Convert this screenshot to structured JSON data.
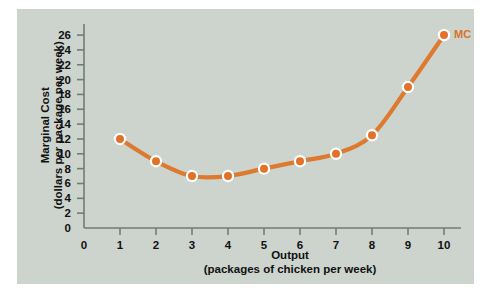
{
  "figure": {
    "panel_color": "#ccd4cd",
    "page_color": "#ffffff",
    "axis_color": "#6f7d76",
    "text_color": "#111111"
  },
  "chart_data": {
    "type": "line",
    "title": "",
    "subtitle": "",
    "xlabel": "Output",
    "xlabel_sub": "(packages of chicken per week)",
    "ylabel": "Marginal Cost",
    "ylabel_sub": "(dollars per package per week)",
    "x": [
      1,
      2,
      3,
      4,
      5,
      6,
      7,
      8,
      9,
      10
    ],
    "values": [
      12,
      9,
      7,
      7,
      8,
      9,
      10,
      12.5,
      19,
      26
    ],
    "series": [
      {
        "name": "MC",
        "color": "#dd7a2e",
        "marker_fill": "#e2722a",
        "marker_edge": "#ffffff",
        "values": [
          12,
          9,
          7,
          7,
          8,
          9,
          10,
          12.5,
          19,
          26
        ]
      }
    ],
    "annotations": [
      {
        "text": "MC",
        "x": 10,
        "y": 26,
        "color": "#d9722c"
      }
    ],
    "xlim": [
      0,
      10.55
    ],
    "ylim": [
      0,
      27.4
    ],
    "xticks": [
      0,
      1,
      2,
      3,
      4,
      5,
      6,
      7,
      8,
      9,
      10
    ],
    "xticklabels": [
      "0",
      "1",
      "2",
      "3",
      "4",
      "5",
      "6",
      "7",
      "8",
      "9",
      "10"
    ],
    "yticks": [
      0,
      2,
      4,
      6,
      8,
      10,
      12,
      14,
      16,
      18,
      20,
      22,
      24,
      26
    ],
    "yticklabels": [
      "0",
      "2",
      "4",
      "6",
      "8",
      "10",
      "12",
      "14",
      "16",
      "18",
      "20",
      "22",
      "24",
      "26"
    ],
    "grid": false,
    "legend_position": "inline-end-of-line"
  }
}
